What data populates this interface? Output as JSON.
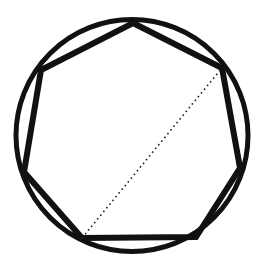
{
  "figure": {
    "canvas": {
      "width": 261,
      "height": 262,
      "background": "#ffffff"
    },
    "colors": {
      "stroke": "#111111",
      "circle_stroke": "#111111",
      "polygon_stroke": "#111111",
      "diagonal_stroke": "#222222",
      "fill": "none",
      "background": "#ffffff"
    },
    "circle": {
      "label": "circumscribed-circle",
      "cx": 132,
      "cy": 135.5,
      "r": 116,
      "stroke_width": 5
    },
    "polygon": {
      "label": "inscribed-heptagon",
      "sides": 7,
      "stroke_width": 6,
      "points": "133,23 222,68 240,168 196,237 82,238 24,172 41,70",
      "vertices": [
        {
          "name": "top",
          "x": 133,
          "y": 23
        },
        {
          "name": "upper-right",
          "x": 222,
          "y": 68
        },
        {
          "name": "right",
          "x": 240,
          "y": 168
        },
        {
          "name": "bottom-right",
          "x": 196,
          "y": 237
        },
        {
          "name": "bottom-left",
          "x": 82,
          "y": 238
        },
        {
          "name": "left",
          "x": 24,
          "y": 172
        },
        {
          "name": "upper-left",
          "x": 41,
          "y": 70
        }
      ]
    },
    "diagonal": {
      "label": "dotted-diagonal",
      "style": "dotted",
      "stroke_width": 1.6,
      "dash_pattern": "1.6 3.2",
      "x1": 82,
      "y1": 238,
      "x2": 222,
      "y2": 68,
      "from_vertex": "bottom-left",
      "to_vertex": "upper-right"
    }
  }
}
